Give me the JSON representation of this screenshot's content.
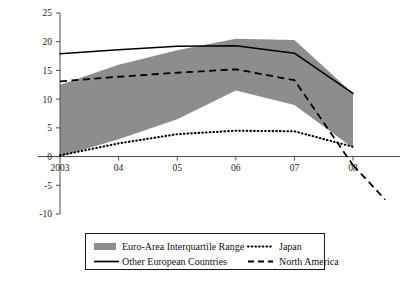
{
  "chart_data": {
    "type": "line",
    "title": "",
    "subtitle": "",
    "xlabel": "",
    "ylabel": "",
    "xlim": [
      2003,
      2008
    ],
    "ylim": [
      -10,
      25
    ],
    "ytick_values": [
      25,
      20,
      15,
      10,
      5,
      0,
      -5,
      -10
    ],
    "ytick_labels": [
      "25",
      "20",
      "15",
      "10",
      "5",
      "0",
      "-5",
      "-10"
    ],
    "xtick_values": [
      2003,
      2004,
      2005,
      2006,
      2007,
      2008
    ],
    "xtick_labels": [
      "2003",
      "04",
      "05",
      "06",
      "07",
      "08"
    ],
    "grid": false,
    "legend_position": "bottom",
    "zero_line": true,
    "x": [
      2003,
      2004,
      2005,
      2006,
      2007,
      2008
    ],
    "band": {
      "name": "Euro-Area Interquartile Range",
      "style": "filled-area",
      "color": "#8d8d8d",
      "upper": [
        12.5,
        16.0,
        18.5,
        20.5,
        20.3,
        11.0
      ],
      "lower": [
        0.0,
        3.0,
        6.5,
        11.5,
        9.0,
        1.5
      ]
    },
    "series": [
      {
        "name": "Other European Countries",
        "style": "solid",
        "color": "#000000",
        "values": [
          17.9,
          18.6,
          19.2,
          19.3,
          18.0,
          11.0
        ]
      },
      {
        "name": "North America",
        "style": "dashed",
        "color": "#000000",
        "values": [
          13.1,
          13.9,
          14.6,
          15.2,
          13.3,
          -1.5
        ],
        "extension_x": [
          2008,
          2008.55
        ],
        "extension_values": [
          -1.5,
          -7.5
        ]
      },
      {
        "name": "Japan",
        "style": "dotted",
        "color": "#000000",
        "values": [
          0.2,
          2.3,
          3.9,
          4.5,
          4.4,
          1.7
        ]
      }
    ]
  },
  "legend": {
    "entries": [
      {
        "label": "Euro-Area Interquartile Range",
        "marker": "swatch"
      },
      {
        "label": "Japan",
        "marker": "dotted"
      },
      {
        "label": "Other European Countries",
        "marker": "solid"
      },
      {
        "label": "North America",
        "marker": "dashed"
      }
    ]
  },
  "axes": {
    "y_labels": [
      "25",
      "20",
      "15",
      "10",
      "5",
      "0",
      "-5",
      "-10"
    ],
    "x_labels": [
      "2003",
      "04",
      "05",
      "06",
      "07",
      "08"
    ]
  },
  "colors": {
    "band": "#8d8d8d",
    "line": "#000000",
    "axis": "#4a4a4a",
    "background": "#ffffff"
  }
}
